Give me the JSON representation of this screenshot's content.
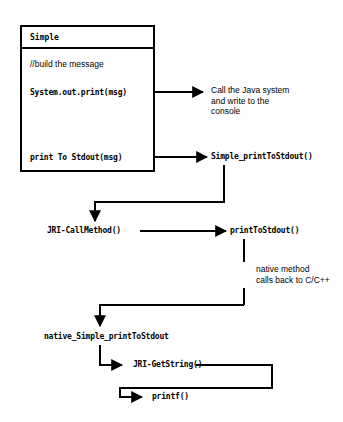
{
  "diagram": {
    "colors": {
      "ink": "#000000",
      "background": "#ffffff"
    },
    "class_box": {
      "name": "Simple",
      "comment": "//build the message",
      "statements": [
        "System.out.print(msg)",
        "print To Stdout(msg)"
      ]
    },
    "nodes": [
      {
        "id": "simple-printtostdout",
        "label": "Simple_printToStdout()"
      },
      {
        "id": "jri-callmethod",
        "label": "JRI-CallMethod()"
      },
      {
        "id": "printtostdout",
        "label": "printToStdout()"
      },
      {
        "id": "native-simple-printtostdout",
        "label": "native_Simple_printToStdout"
      },
      {
        "id": "jri-getstring",
        "label": "JRI-GetString()"
      },
      {
        "id": "printf",
        "label": "printf()"
      }
    ],
    "annotations": [
      {
        "id": "java-system-note",
        "lines": [
          "Call the Java system",
          "and write to the",
          "console"
        ]
      },
      {
        "id": "native-callback-note",
        "lines": [
          "native method",
          "calls back to C/C++"
        ]
      }
    ]
  }
}
